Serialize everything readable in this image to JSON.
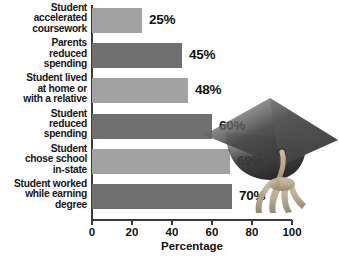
{
  "chart_data": {
    "type": "bar",
    "orientation": "horizontal",
    "title": "",
    "xlabel": "Percentage",
    "ylabel": "",
    "xlim": [
      0,
      100
    ],
    "xticks": [
      0,
      20,
      40,
      60,
      80,
      100
    ],
    "grid": false,
    "legend": null,
    "categories": [
      "Student accelerated coursework",
      "Parents reduced spending",
      "Student lived at home or with a relative",
      "Student reduced spending",
      "Student chose school in-state",
      "Student worked while earning degree"
    ],
    "category_lines": [
      [
        "Student",
        "accelerated",
        "coursework"
      ],
      [
        "Parents",
        "reduced",
        "spending"
      ],
      [
        "Student lived",
        "at home or",
        "with a relative"
      ],
      [
        "Student",
        "reduced",
        "spending"
      ],
      [
        "Student",
        "chose school",
        "in-state"
      ],
      [
        "Student worked",
        "while earning",
        "degree"
      ]
    ],
    "values": [
      25,
      45,
      48,
      60,
      69,
      70
    ],
    "value_labels": [
      "25%",
      "45%",
      "48%",
      "60%",
      "69%",
      "70%"
    ],
    "bar_shades": [
      "light",
      "dark",
      "light",
      "dark",
      "light",
      "dark"
    ]
  },
  "colors": {
    "bar_light": "#a2a2a2",
    "bar_dark": "#6f6f6f",
    "axis": "#3a3a3a",
    "text": "#111111",
    "cap_dark": "#3c3c3c",
    "cap_mid": "#585858",
    "tassel": "#b9a887",
    "background": "#ffffff"
  },
  "decoration": {
    "name": "graduation-cap",
    "parts": [
      "mortarboard",
      "cap-crown",
      "tassel"
    ]
  }
}
